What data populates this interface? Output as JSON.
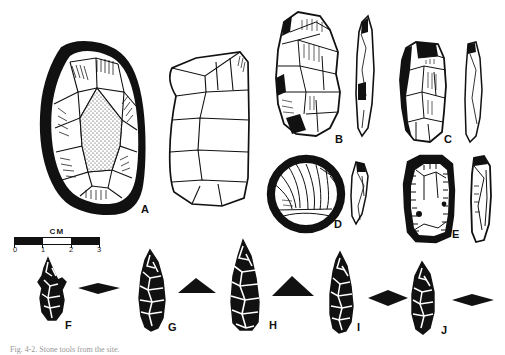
{
  "figure": {
    "type": "archaeological-lithic-plate",
    "medium": "pen-and-ink line drawing",
    "background_color": "#ffffff",
    "ink_color": "#111111",
    "caption": "Fig. 4-2. Stone tools from the site.",
    "caption_visible": "partially cropped at bottom edge"
  },
  "scale": {
    "unit_label": "CM",
    "ticks": [
      "0",
      "1",
      "2",
      "3"
    ],
    "segments": 3,
    "style": "alternating filled bar"
  },
  "specimens": [
    {
      "id": "A",
      "label": "A",
      "description": "Large bifacial core / chopper, face view with stippled cortex and radial flake scars, plus side profile view",
      "views": [
        "face",
        "profile"
      ],
      "has_cross_section": false
    },
    {
      "id": "B",
      "label": "B",
      "description": "Thick flake tool with steep retouch, face view plus narrow edge profile",
      "views": [
        "face",
        "profile"
      ],
      "has_cross_section": false
    },
    {
      "id": "C",
      "label": "C",
      "description": "Elongate sidescraper with dense unifacial retouch along left margin, face view plus thin profile",
      "views": [
        "face",
        "profile"
      ],
      "has_cross_section": false
    },
    {
      "id": "D",
      "label": "D",
      "description": "Circular discoidal scraper with radiating flake scars, face view plus profile",
      "views": [
        "face",
        "profile"
      ],
      "has_cross_section": false
    },
    {
      "id": "E",
      "label": "E",
      "description": "Rectangular endscraper with continuous marginal retouch, face view plus profile",
      "views": [
        "face",
        "profile"
      ],
      "has_cross_section": false
    },
    {
      "id": "F",
      "label": "F",
      "description": "Small side-notched biface point, face view with lenticular cross-section",
      "views": [
        "face"
      ],
      "has_cross_section": true,
      "cross_section": "lenticular"
    },
    {
      "id": "G",
      "label": "G",
      "description": "Leaf-shaped lanceolate biface, face view with plano-convex cross-section",
      "views": [
        "face"
      ],
      "has_cross_section": true,
      "cross_section": "plano-convex"
    },
    {
      "id": "H",
      "label": "H",
      "description": "Large triangular lanceolate point, face view with plano-convex cross-section",
      "views": [
        "face"
      ],
      "has_cross_section": true,
      "cross_section": "plano-convex"
    },
    {
      "id": "I",
      "label": "I",
      "description": "Narrow willow-leaf point, face view with lenticular cross-section",
      "views": [
        "face"
      ],
      "has_cross_section": true,
      "cross_section": "lenticular"
    },
    {
      "id": "J",
      "label": "J",
      "description": "Small ovate leaf-shaped biface, face view with thin lenticular cross-section",
      "views": [
        "face"
      ],
      "has_cross_section": true,
      "cross_section": "thin lenticular"
    }
  ],
  "label_positions": {
    "A": {
      "x": 141,
      "y": 204
    },
    "B": {
      "x": 335,
      "y": 134
    },
    "C": {
      "x": 444,
      "y": 134
    },
    "D": {
      "x": 334,
      "y": 219
    },
    "E": {
      "x": 452,
      "y": 229
    },
    "F": {
      "x": 65,
      "y": 320
    },
    "G": {
      "x": 168,
      "y": 322
    },
    "H": {
      "x": 269,
      "y": 320
    },
    "I": {
      "x": 357,
      "y": 322
    },
    "J": {
      "x": 441,
      "y": 325
    }
  }
}
